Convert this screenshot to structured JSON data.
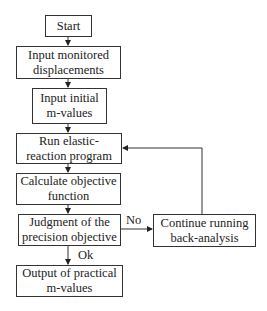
{
  "diagram": {
    "type": "flowchart",
    "nodes": {
      "start": "Start",
      "input_displacements": "Input monitored\ndisplacements",
      "input_m": "Input initial\nm-values",
      "run_program": "Run elastic-\nreaction program",
      "calc_objective": "Calculate objective\nfunction",
      "judgment": "Judgment of the\nprecision objective",
      "continue": "Continue running\nback-analysis",
      "output": "Output of practical\nm-values"
    },
    "edge_labels": {
      "no": "No",
      "ok": "Ok"
    },
    "edges": [
      [
        "start",
        "input_displacements"
      ],
      [
        "input_displacements",
        "input_m"
      ],
      [
        "input_m",
        "run_program"
      ],
      [
        "run_program",
        "calc_objective"
      ],
      [
        "calc_objective",
        "judgment"
      ],
      [
        "judgment",
        "continue",
        "No"
      ],
      [
        "continue",
        "run_program"
      ],
      [
        "judgment",
        "output",
        "Ok"
      ]
    ]
  }
}
